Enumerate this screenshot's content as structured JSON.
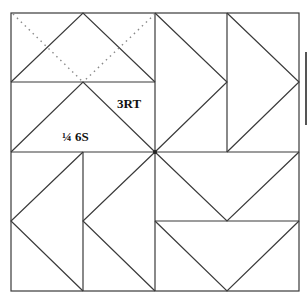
{
  "diagram": {
    "type": "quilt-block",
    "grid": {
      "cols": 4,
      "rows": 4
    },
    "line_color": "#3a3a3a",
    "dotted_color": "#8a8a8a",
    "labels": {
      "piece_a": "3RT",
      "piece_b": "¼ 6S"
    }
  },
  "side_bar": {
    "color": "#555555"
  }
}
